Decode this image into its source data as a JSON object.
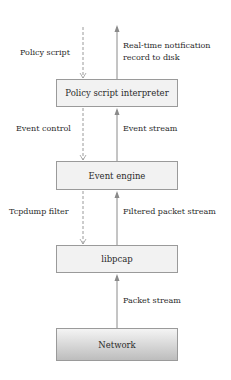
{
  "diagram": {
    "boxes": [
      {
        "id": "interpreter",
        "label": "Policy script interpreter"
      },
      {
        "id": "engine",
        "label": "Event engine"
      },
      {
        "id": "libpcap",
        "label": "libpcap"
      },
      {
        "id": "network",
        "label": "Network"
      }
    ],
    "left_labels": {
      "policy_script": "Policy script",
      "event_control": "Event control",
      "tcpdump_filter": "Tcpdump filter"
    },
    "right_labels": {
      "notification_line1": "Real-time notification",
      "notification_line2": "record to disk",
      "event_stream": "Event stream",
      "filtered_packet_stream": "Filtered packet stream",
      "packet_stream": "Packet stream"
    },
    "colors": {
      "box_fill": "#f2f2f2",
      "box_border": "#9a9a9a",
      "arrow": "#8a8a8a"
    }
  }
}
